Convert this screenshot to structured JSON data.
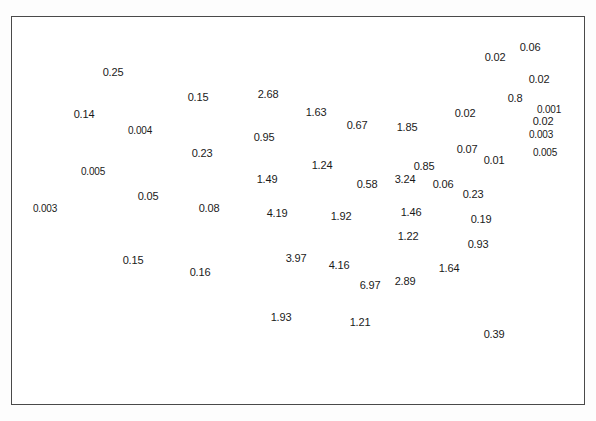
{
  "figure": {
    "width": 596,
    "height": 421,
    "background_color": "#ffffff",
    "frame_color": "#4a4a4a",
    "outline_color": "#111111",
    "state_border_style": "dash-dot",
    "label_color": "#1a1a1a"
  },
  "chart_data": {
    "type": "map",
    "title": "",
    "xlabel": "",
    "ylabel": "",
    "units": "",
    "regions": [
      {
        "name": "Washington",
        "value": "0.25",
        "x": 113,
        "y": 72
      },
      {
        "name": "Oregon",
        "value": "0.14",
        "x": 84,
        "y": 114
      },
      {
        "name": "Idaho",
        "value": "0.004",
        "x": 140,
        "y": 131
      },
      {
        "name": "Montana",
        "value": "0.15",
        "x": 198,
        "y": 97
      },
      {
        "name": "North Dakota",
        "value": "2.68",
        "x": 268,
        "y": 94
      },
      {
        "name": "Minnesota",
        "value": "1.63",
        "x": 316,
        "y": 112
      },
      {
        "name": "South Dakota",
        "value": "0.95",
        "x": 264,
        "y": 137
      },
      {
        "name": "Wyoming",
        "value": "0.23",
        "x": 202,
        "y": 153
      },
      {
        "name": "Nebraska",
        "value": "1.49",
        "x": 267,
        "y": 179
      },
      {
        "name": "Nevada",
        "value": "0.005",
        "x": 93,
        "y": 172
      },
      {
        "name": "Utah",
        "value": "0.05",
        "x": 148,
        "y": 196
      },
      {
        "name": "Colorado",
        "value": "0.08",
        "x": 209,
        "y": 208
      },
      {
        "name": "Kansas",
        "value": "4.19",
        "x": 277,
        "y": 213
      },
      {
        "name": "California",
        "value": "0.003",
        "x": 45,
        "y": 209
      },
      {
        "name": "Arizona",
        "value": "0.15",
        "x": 133,
        "y": 260
      },
      {
        "name": "New Mexico",
        "value": "0.16",
        "x": 200,
        "y": 272
      },
      {
        "name": "Oklahoma",
        "value": "3.97",
        "x": 296,
        "y": 258
      },
      {
        "name": "Texas",
        "value": "1.93",
        "x": 281,
        "y": 317
      },
      {
        "name": "Iowa",
        "value": "1.24",
        "x": 322,
        "y": 165
      },
      {
        "name": "Missouri",
        "value": "1.92",
        "x": 341,
        "y": 216
      },
      {
        "name": "Arkansas",
        "value": "4.16",
        "x": 339,
        "y": 265
      },
      {
        "name": "Louisiana",
        "value": "1.21",
        "x": 360,
        "y": 322
      },
      {
        "name": "Wisconsin",
        "value": "0.67",
        "x": 357,
        "y": 125
      },
      {
        "name": "Michigan",
        "value": "1.85",
        "x": 407,
        "y": 127
      },
      {
        "name": "Illinois",
        "value": "0.58",
        "x": 367,
        "y": 184
      },
      {
        "name": "Indiana",
        "value": "3.24",
        "x": 405,
        "y": 179
      },
      {
        "name": "Ohio",
        "value": "0.85",
        "x": 424,
        "y": 166
      },
      {
        "name": "Kentucky",
        "value": "1.46",
        "x": 411,
        "y": 212
      },
      {
        "name": "Tennessee",
        "value": "1.22",
        "x": 408,
        "y": 236
      },
      {
        "name": "Mississippi",
        "value": "6.97",
        "x": 370,
        "y": 285
      },
      {
        "name": "Alabama",
        "value": "2.89",
        "x": 405,
        "y": 281
      },
      {
        "name": "Georgia",
        "value": "1.64",
        "x": 449,
        "y": 268
      },
      {
        "name": "Florida",
        "value": "0.39",
        "x": 494,
        "y": 334
      },
      {
        "name": "South Carolina",
        "value": "0.93",
        "x": 478,
        "y": 244
      },
      {
        "name": "North Carolina",
        "value": "0.19",
        "x": 481,
        "y": 219
      },
      {
        "name": "Virginia",
        "value": "0.23",
        "x": 473,
        "y": 194
      },
      {
        "name": "West Virginia",
        "value": "0.06",
        "x": 443,
        "y": 184
      },
      {
        "name": "Pennsylvania",
        "value": "0.07",
        "x": 467,
        "y": 149
      },
      {
        "name": "New York",
        "value": "0.02",
        "x": 465,
        "y": 113
      },
      {
        "name": "Vermont",
        "value": "0.02",
        "x": 495,
        "y": 57
      },
      {
        "name": "Maine",
        "value": "0.06",
        "x": 530,
        "y": 47
      },
      {
        "name": "New Hampshire",
        "value": "0.02",
        "x": 539,
        "y": 79
      },
      {
        "name": "Massachusetts",
        "value": "0.8",
        "x": 515,
        "y": 98
      },
      {
        "name": "Rhode Island",
        "value": "0.001",
        "x": 549,
        "y": 110
      },
      {
        "name": "Connecticut",
        "value": "0.02",
        "x": 543,
        "y": 121
      },
      {
        "name": "New Jersey",
        "value": "0.003",
        "x": 541,
        "y": 135
      },
      {
        "name": "Delaware",
        "value": "0.005",
        "x": 545,
        "y": 153
      },
      {
        "name": "Maryland",
        "value": "0.01",
        "x": 494,
        "y": 160
      }
    ]
  }
}
